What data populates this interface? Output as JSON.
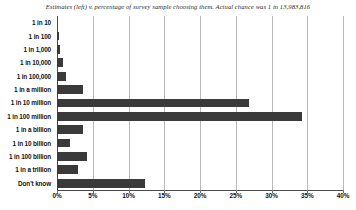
{
  "chart_data": {
    "type": "bar",
    "orientation": "horizontal",
    "title": "Estimates (left) v. percentage of survey sample choosing them. Actual chance was 1 in 13,983,816",
    "xlabel": "",
    "ylabel": "",
    "xlim": [
      0,
      40
    ],
    "xticks": [
      0,
      5,
      10,
      15,
      20,
      25,
      30,
      35,
      40
    ],
    "xtick_labels": [
      "0%",
      "5%",
      "10%",
      "15%",
      "20%",
      "25%",
      "30%",
      "35%",
      "40%"
    ],
    "grid": true,
    "legend": "none",
    "bar_color": "#3a3a3a",
    "categories": [
      "1 in 10",
      "1 in 100",
      "1 in 1,000",
      "1 in 10,000",
      "1 in 100,000",
      "1 in a million",
      "1 in 10 million",
      "1 in 100 million",
      "1 in a billion",
      "1 in 10 billion",
      "1 in 100 billion",
      "1 in a trillion",
      "Don't know"
    ],
    "values": [
      0,
      0.3,
      0.4,
      0.9,
      1.3,
      3.7,
      26.8,
      34.3,
      3.7,
      1.8,
      4.2,
      2.9,
      12.3
    ]
  }
}
